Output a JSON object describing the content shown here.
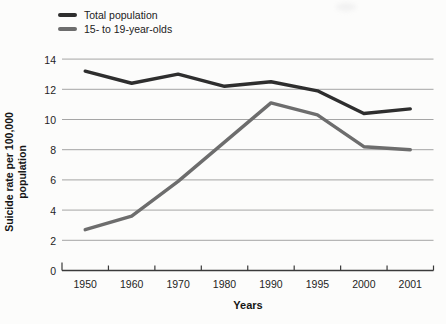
{
  "colors": {
    "background": "#fcfcfb",
    "total_line": "#2e2e2e",
    "teen_line": "#6d6d6d",
    "gridline": "#9b9b9b",
    "axis": "#3a3a3a",
    "text": "#1e1e1e"
  },
  "chart_data": {
    "type": "line",
    "x": [
      "1950",
      "1960",
      "1970",
      "1980",
      "1990",
      "1995",
      "2000",
      "2001"
    ],
    "series": [
      {
        "name": "Total population",
        "color": "#2e2e2e",
        "values": [
          13.2,
          12.4,
          13.0,
          12.2,
          12.5,
          11.9,
          10.4,
          10.7
        ]
      },
      {
        "name": "15- to 19-year-olds",
        "color": "#6d6d6d",
        "values": [
          2.7,
          3.6,
          5.9,
          8.5,
          11.1,
          10.3,
          8.2,
          8.0
        ]
      }
    ],
    "title": "",
    "xlabel": "Years",
    "ylabel": "Suicide rate per 100,000\npopulation",
    "ylim": [
      0,
      14
    ],
    "yticks": [
      0,
      2,
      4,
      6,
      8,
      10,
      12,
      14
    ],
    "grid": true,
    "legend_position": "top-left"
  }
}
